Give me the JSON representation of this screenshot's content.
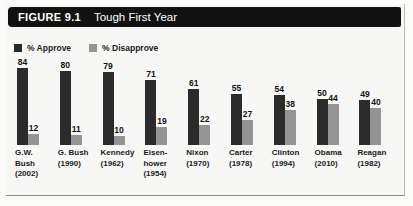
{
  "figure": {
    "number_label": "FIGURE 9.1",
    "title": "Tough First Year"
  },
  "legend": {
    "items": [
      {
        "label": "% Approve",
        "color": "#2b2b2b",
        "icon": "square-swatch-icon"
      },
      {
        "label": "% Disapprove",
        "color": "#949494",
        "icon": "square-swatch-icon"
      }
    ]
  },
  "chart_data": {
    "type": "bar",
    "title": "Tough First Year",
    "xlabel": "",
    "ylabel": "",
    "ylim": [
      0,
      90
    ],
    "grid": false,
    "legend_position": "top-left",
    "categories": [
      "G.W. Bush (2002)",
      "G. Bush (1990)",
      "Kennedy (1962)",
      "Eisenhower (1954)",
      "Nixon (1970)",
      "Carter (1978)",
      "Clinton (1994)",
      "Obama (2010)",
      "Reagan (1982)"
    ],
    "category_lines": [
      [
        "G.W.",
        "Bush",
        "(2002)"
      ],
      [
        "G. Bush",
        "(1990)"
      ],
      [
        "Kennedy",
        "(1962)"
      ],
      [
        "Eisen-",
        "hower",
        "(1954)"
      ],
      [
        "Nixon",
        "(1970)"
      ],
      [
        "Carter",
        "(1978)"
      ],
      [
        "Clinton",
        "(1994)"
      ],
      [
        "Obama",
        "(2010)"
      ],
      [
        "Reagan",
        "(1982)"
      ]
    ],
    "series": [
      {
        "name": "% Approve",
        "color": "#2b2b2b",
        "values": [
          84,
          80,
          79,
          71,
          61,
          55,
          54,
          50,
          49
        ]
      },
      {
        "name": "% Disapprove",
        "color": "#949494",
        "values": [
          12,
          11,
          10,
          19,
          22,
          27,
          38,
          44,
          40
        ]
      }
    ]
  }
}
